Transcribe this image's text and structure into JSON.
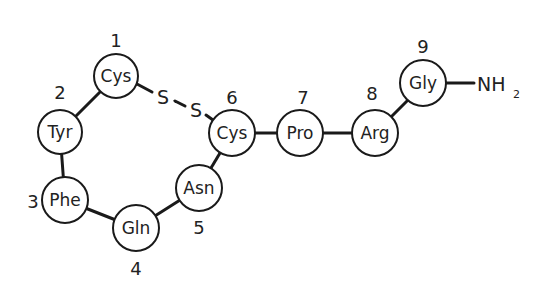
{
  "diagram": {
    "title": "",
    "residues": [
      {
        "index": "1",
        "name": "Cys",
        "cx": 116,
        "cy": 76,
        "lx": 116,
        "ly": 40
      },
      {
        "index": "2",
        "name": "Tyr",
        "cx": 60,
        "cy": 132,
        "lx": 60,
        "ly": 93
      },
      {
        "index": "3",
        "name": "Phe",
        "cx": 65,
        "cy": 200,
        "lx": 33,
        "ly": 201
      },
      {
        "index": "4",
        "name": "Gln",
        "cx": 136,
        "cy": 228,
        "lx": 136,
        "ly": 268
      },
      {
        "index": "5",
        "name": "Asn",
        "cx": 199,
        "cy": 188,
        "lx": 199,
        "ly": 227
      },
      {
        "index": "6",
        "name": "Cys",
        "cx": 232,
        "cy": 133,
        "lx": 232,
        "ly": 97
      },
      {
        "index": "7",
        "name": "Pro",
        "cx": 300,
        "cy": 133,
        "lx": 303,
        "ly": 97
      },
      {
        "index": "8",
        "name": "Arg",
        "cx": 375,
        "cy": 133,
        "lx": 372,
        "ly": 93
      },
      {
        "index": "9",
        "name": "Gly",
        "cx": 423,
        "cy": 85,
        "lx": 423,
        "ly": 47
      }
    ],
    "disulfide": {
      "atom1": "S",
      "atom2": "S",
      "label": "S–S"
    },
    "terminal": {
      "group": "NH",
      "subscript": "2"
    }
  }
}
